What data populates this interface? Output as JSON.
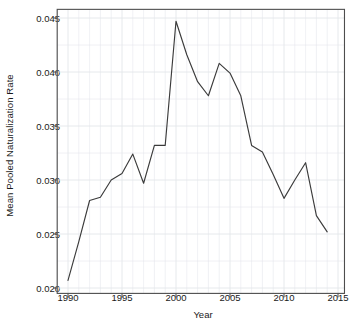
{
  "chart_data": {
    "type": "line",
    "title": "",
    "xlabel": "Year",
    "ylabel": "Mean Pooled Naturalization Rate",
    "xlim": [
      1989.0,
      2015.6
    ],
    "ylim": [
      0.0195,
      0.0458
    ],
    "grid": true,
    "legend": null,
    "line_color": "#3b3b3b",
    "grid_color": "#e3e6ea",
    "axis_color": "#4d4d4d",
    "background": "#ffffff",
    "x": [
      1990,
      1991,
      1992,
      1993,
      1994,
      1995,
      1996,
      1997,
      1998,
      1999,
      2000,
      2001,
      2002,
      2003,
      2004,
      2005,
      2006,
      2007,
      2008,
      2009,
      2010,
      2011,
      2012,
      2013,
      2014
    ],
    "values": [
      0.0207,
      0.0243,
      0.0281,
      0.0284,
      0.03,
      0.0306,
      0.0324,
      0.0297,
      0.0332,
      0.0332,
      0.0447,
      0.0416,
      0.0391,
      0.0378,
      0.0408,
      0.0399,
      0.0378,
      0.0332,
      0.0326,
      0.0305,
      0.0283,
      0.03,
      0.0316,
      0.0267,
      0.0252
    ],
    "xticks": [
      1990,
      1995,
      2000,
      2005,
      2010,
      2015
    ],
    "xtick_labels": [
      "1990",
      "1995",
      "2000",
      "2005",
      "2010",
      "2015"
    ],
    "yticks": [
      0.02,
      0.025,
      0.03,
      0.035,
      0.04,
      0.045
    ],
    "ytick_labels": [
      "0.020",
      "0.025",
      "0.030",
      "0.035",
      "0.040",
      "0.045"
    ],
    "x_minor_step": 1,
    "y_minor_step": 0.0025
  }
}
